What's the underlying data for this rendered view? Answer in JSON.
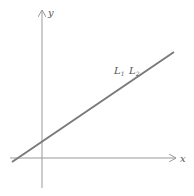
{
  "diagram": {
    "type": "coordinate-plane-line",
    "axes": {
      "x_label": "x",
      "y_label": "y"
    },
    "line": {
      "label_1": "L",
      "sub_1": "1",
      "label_2": "L",
      "sub_2": "2",
      "color": "#7a7a7a"
    },
    "axis_color": "#999999"
  }
}
